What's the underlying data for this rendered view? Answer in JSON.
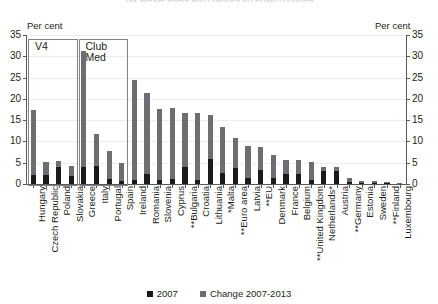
{
  "chart_title": "Tax wedge levels and changes in certain countries",
  "axis": {
    "left_unit": "Per cent",
    "right_unit": "Per cent",
    "ticks": [
      0,
      5,
      10,
      15,
      20,
      25,
      30,
      35
    ],
    "ymin": 0,
    "ymax": 35
  },
  "legend": {
    "items": [
      {
        "label": "2007",
        "color": "#1a1a1a"
      },
      {
        "label": "Change 2007-2013",
        "color": "#6d6e71"
      }
    ]
  },
  "annotations": [
    {
      "id": "v4",
      "label": "V4",
      "start_index": 0,
      "end_index": 3
    },
    {
      "id": "club-med",
      "label": "Club\nMed",
      "start_index": 4,
      "end_index": 7
    }
  ],
  "chart_data": {
    "type": "bar",
    "stacked": true,
    "title": "Tax wedge levels and changes in certain countries",
    "xlabel": "",
    "ylabel": "Per cent",
    "ylim": [
      0,
      35
    ],
    "grid": true,
    "legend_position": "bottom",
    "categories": [
      "Hungary",
      "Czech Republic",
      "Poland",
      "Slovakia",
      "Greece",
      "Italy",
      "Portugal",
      "Spain",
      "Ireland",
      "Romania",
      "Slovenia",
      "Cyprus",
      "**Bulgaria",
      "Croatia",
      "Lithuania",
      "*Malta",
      "**Euro area",
      "Latvia",
      "**EU",
      "Denmark",
      "France",
      "Belgium",
      "**United Kingdom",
      "Netherlands*",
      "Austria",
      "**Germany",
      "Estonia",
      "Sweden",
      "**Finland",
      "Luxembourg"
    ],
    "series": [
      {
        "name": "2007",
        "color": "#1a1a1a",
        "values": [
          2.2,
          2.1,
          3.9,
          1.9,
          4.1,
          4.3,
          1.1,
          0.7,
          0.9,
          2.4,
          1.0,
          1.2,
          4.0,
          1.0,
          5.8,
          2.5,
          3.7,
          1.5,
          3.4,
          1.5,
          2.4,
          2.4,
          1.0,
          3.0,
          3.0,
          0.5,
          0.3,
          0.2,
          0.2,
          0.1
        ]
      },
      {
        "name": "Change 2007-2013",
        "color": "#6d6e71",
        "values": [
          15.3,
          3.0,
          1.4,
          2.4,
          27.2,
          7.5,
          6.6,
          4.2,
          23.6,
          19.1,
          16.7,
          16.6,
          12.6,
          15.7,
          10.5,
          11.0,
          7.1,
          7.5,
          5.3,
          5.3,
          3.2,
          3.2,
          4.2,
          1.0,
          1.0,
          1.0,
          0.5,
          0.4,
          0.2,
          0.1
        ]
      }
    ],
    "totals": [
      17.5,
      5.1,
      5.3,
      4.3,
      31.3,
      11.8,
      7.7,
      4.9,
      24.5,
      21.5,
      17.7,
      17.8,
      16.6,
      16.7,
      16.3,
      13.5,
      10.8,
      9.0,
      8.7,
      6.8,
      5.6,
      5.6,
      5.2,
      4.0,
      4.0,
      1.5,
      0.8,
      0.6,
      0.4,
      0.2
    ]
  }
}
